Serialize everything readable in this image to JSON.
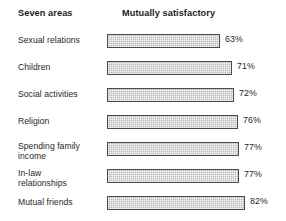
{
  "header": {
    "category_column": "Seven areas",
    "series_column": "Mutually satisfactory"
  },
  "style": {
    "bar_fill": "#b9b9b9",
    "bar_border": "#4a4a4a",
    "text_color": "#1f1f1f",
    "background": "#ffffff"
  },
  "rows": [
    {
      "label_line1": "Sexual relations",
      "label_line2": "",
      "value": "63%",
      "value_num": 63,
      "bar_px": 113,
      "top": 33
    },
    {
      "label_line1": "Children",
      "label_line2": "",
      "value": "71%",
      "value_num": 71,
      "bar_px": 125,
      "top": 60
    },
    {
      "label_line1": "Social activities",
      "label_line2": "",
      "value": "72%",
      "value_num": 72,
      "bar_px": 127,
      "top": 87
    },
    {
      "label_line1": "Religion",
      "label_line2": "",
      "value": "76%",
      "value_num": 76,
      "bar_px": 131,
      "top": 114
    },
    {
      "label_line1": "Spending family",
      "label_line2": "income",
      "value": "77%",
      "value_num": 77,
      "bar_px": 132,
      "top": 141
    },
    {
      "label_line1": "In-law",
      "label_line2": "relationships",
      "value": "77%",
      "value_num": 77,
      "bar_px": 132,
      "top": 168
    },
    {
      "label_line1": "Mutual friends",
      "label_line2": "",
      "value": "82%",
      "value_num": 82,
      "bar_px": 138,
      "top": 195
    }
  ],
  "chart_data": {
    "type": "bar",
    "orientation": "horizontal",
    "title": "",
    "xlabel": "Mutually satisfactory",
    "ylabel": "Seven areas",
    "categories": [
      "Sexual relations",
      "Children",
      "Social activities",
      "Religion",
      "Spending family income",
      "In-law relationships",
      "Mutual friends"
    ],
    "values": [
      63,
      71,
      72,
      76,
      77,
      77,
      82
    ],
    "value_labels": [
      "63%",
      "71%",
      "72%",
      "76%",
      "77%",
      "77%",
      "82%"
    ],
    "unit": "percent",
    "grid": false,
    "legend": "none",
    "series": [
      {
        "name": "Mutually satisfactory",
        "values": [
          63,
          71,
          72,
          76,
          77,
          77,
          82
        ]
      }
    ]
  }
}
